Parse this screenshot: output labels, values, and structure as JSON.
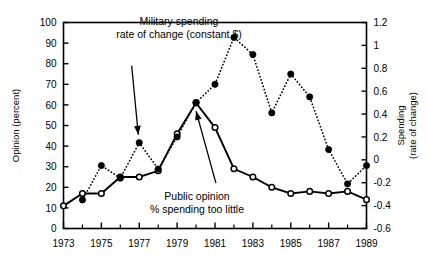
{
  "chart_data": {
    "type": "line",
    "title": "",
    "xlabel": "",
    "ylabel": "Opinion (percent)",
    "y2label_line1": "Spending",
    "y2label_line2": "(rate of change)",
    "x": [
      1973,
      1974,
      1975,
      1976,
      1977,
      1978,
      1979,
      1980,
      1981,
      1982,
      1983,
      1984,
      1985,
      1986,
      1987,
      1988,
      1989
    ],
    "xlim": [
      1973,
      1989
    ],
    "ylim": [
      0,
      100
    ],
    "y2lim": [
      -0.6,
      1.2
    ],
    "xticklabels": [
      "1973",
      "1975",
      "1977",
      "1979",
      "1981",
      "1983",
      "1985",
      "1987",
      "1989"
    ],
    "xtickvalues": [
      1973,
      1975,
      1977,
      1979,
      1981,
      1983,
      1985,
      1987,
      1989
    ],
    "xminorticks": [
      1974,
      1976,
      1978,
      1980,
      1982,
      1984,
      1986,
      1988
    ],
    "yticklabels": [
      "0",
      "10",
      "20",
      "30",
      "40",
      "50",
      "60",
      "70",
      "80",
      "90",
      "100"
    ],
    "ytickvalues": [
      0,
      10,
      20,
      30,
      40,
      50,
      60,
      70,
      80,
      90,
      100
    ],
    "y2ticklabels": [
      "-0.6",
      "-0.4",
      "-0.2",
      "0",
      "0.2",
      "0.4",
      "0.6",
      "0.8",
      "1",
      "1.2"
    ],
    "y2tickvalues": [
      -0.6,
      -0.4,
      -0.2,
      0,
      0.2,
      0.4,
      0.6,
      0.8,
      1.0,
      1.2
    ],
    "grid": false,
    "legend_position": "none",
    "series": [
      {
        "name": "Public opinion % spending too little",
        "axis": "left",
        "marker": "open-circle",
        "linestyle": "solid",
        "color": "#000000",
        "x": [
          1973,
          1974,
          1975,
          1976,
          1977,
          1978,
          1979,
          1980,
          1981,
          1982,
          1983,
          1984,
          1985,
          1986,
          1987,
          1988,
          1989
        ],
        "values": [
          11,
          17,
          17,
          25,
          25,
          28,
          46,
          61,
          49,
          29,
          25,
          20,
          17,
          18,
          17,
          18,
          14
        ]
      },
      {
        "name": "Military spending rate of change (constant $)",
        "axis": "right",
        "marker": "filled-circle",
        "linestyle": "dotted",
        "color": "#000000",
        "x": [
          1974,
          1975,
          1976,
          1977,
          1978,
          1979,
          1980,
          1981,
          1982,
          1983,
          1984,
          1985,
          1986,
          1987,
          1988,
          1989
        ],
        "values": [
          -0.35,
          -0.05,
          -0.16,
          0.15,
          -0.08,
          0.2,
          0.5,
          0.66,
          1.07,
          0.92,
          0.41,
          0.75,
          0.55,
          0.09,
          -0.21,
          -0.05
        ]
      }
    ],
    "annotations": [
      {
        "id": "military-spending-annotation",
        "text_line1": "Military spending",
        "text_line2": "rate of change (constant $)",
        "arrow_from_x": 1976.6,
        "arrow_from_y_pct": 79,
        "arrow_to_x": 1976.95,
        "arrow_to_y_pct": 45.5
      },
      {
        "id": "public-opinion-annotation",
        "text_line1": "Public opinion",
        "text_line2": "% spending too little",
        "arrow_from_x": 1981.05,
        "arrow_from_y_pct": 22,
        "arrow_to_x": 1980.0,
        "arrow_to_y_pct": 57
      }
    ]
  }
}
